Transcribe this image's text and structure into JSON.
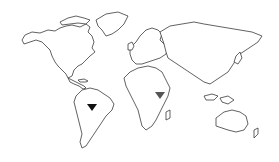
{
  "map": {
    "type": "world-outline",
    "background": "#ffffff",
    "outline_color": "#3a3a3a",
    "markers": [
      {
        "name": "brazil-marker",
        "region": "Brazil",
        "shape": "triangle-down",
        "color": "#111111",
        "x": 92,
        "y": 108
      },
      {
        "name": "ethiopia-marker",
        "region": "Ethiopia",
        "shape": "triangle-down",
        "color": "#555555",
        "x": 160,
        "y": 96
      }
    ]
  }
}
